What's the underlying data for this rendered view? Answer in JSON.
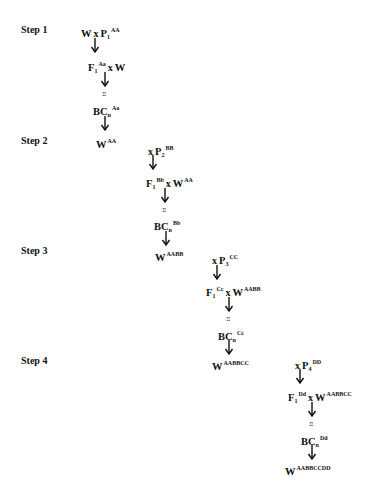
{
  "steps": [
    {
      "label": "Step 1",
      "cross1": {
        "left": "W",
        "op": "x",
        "parent": "P",
        "parent_sub": "1",
        "parent_sup": "AA"
      },
      "f1": {
        "base": "F",
        "sub": "1",
        "sup": "Aa",
        "op": "x",
        "recurrent": "W",
        "recurrent_sup": ""
      },
      "dots": "::",
      "bc": {
        "base": "BC",
        "sub": "n",
        "sup": "Aa"
      },
      "result": {
        "base": "W",
        "sup": "AA"
      }
    },
    {
      "label": "Step 2",
      "cross1": {
        "left": "",
        "op": "x",
        "parent": "P",
        "parent_sub": "2",
        "parent_sup": "BB"
      },
      "f1": {
        "base": "F",
        "sub": "1",
        "sup": "Bb",
        "op": "x",
        "recurrent": "W",
        "recurrent_sup": "AA"
      },
      "dots": "::",
      "bc": {
        "base": "BC",
        "sub": "n",
        "sup": "Bb"
      },
      "result": {
        "base": "W",
        "sup": "AABB"
      }
    },
    {
      "label": "Step 3",
      "cross1": {
        "left": "",
        "op": "x",
        "parent": "P",
        "parent_sub": "3",
        "parent_sup": "CC"
      },
      "f1": {
        "base": "F",
        "sub": "1",
        "sup": "Cc",
        "op": "x",
        "recurrent": "W",
        "recurrent_sup": "AABB"
      },
      "dots": "::",
      "bc": {
        "base": "BC",
        "sub": "n",
        "sup": "Cc"
      },
      "result": {
        "base": "W",
        "sup": "AABBCC"
      }
    },
    {
      "label": "Step 4",
      "cross1": {
        "left": "",
        "op": "x",
        "parent": "P",
        "parent_sub": "4",
        "parent_sup": "DD"
      },
      "f1": {
        "base": "F",
        "sub": "1",
        "sup": "Dd",
        "op": "x",
        "recurrent": "W",
        "recurrent_sup": "AABBCC"
      },
      "dots": "::",
      "bc": {
        "base": "BC",
        "sub": "n",
        "sup": "Dd"
      },
      "result": {
        "base": "W",
        "sup": "AABBCCDD"
      }
    }
  ],
  "colors": {
    "text": "#111111",
    "background": "#ffffff"
  }
}
